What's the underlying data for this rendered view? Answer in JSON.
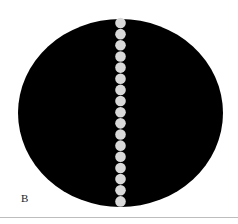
{
  "figure": {
    "label": "B",
    "disc": {
      "cx": 120.5,
      "cy": 113,
      "rx": 102.5,
      "ry": 94,
      "color": "#000000"
    },
    "dots": {
      "count": 17,
      "cx": 120.5,
      "y_start": 23,
      "spacing": 11.15,
      "r": 5.3,
      "color": "#d9d9d9"
    }
  }
}
